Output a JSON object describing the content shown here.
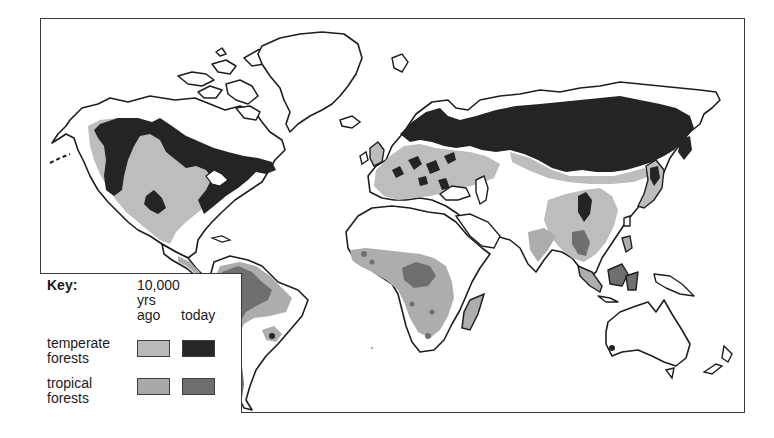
{
  "map": {
    "title": "World forest cover: 10,000 years ago vs today",
    "regions": [
      "North America",
      "Greenland",
      "South America",
      "Europe",
      "Africa",
      "Madagascar",
      "Asia",
      "Japan",
      "Southeast Asia",
      "Australia",
      "New Zealand"
    ]
  },
  "key": {
    "title": "Key:",
    "columns": {
      "ago_line1": "10,000",
      "ago_line2": "yrs",
      "ago_line3": "ago",
      "today": "today"
    },
    "rows": [
      {
        "label_line1": "temperate",
        "label_line2": "forests",
        "ago_color": "#b9b9b9",
        "today_color": "#262626"
      },
      {
        "label_line1": "tropical",
        "label_line2": "forests",
        "ago_color": "#a9a9a9",
        "today_color": "#6e6e6e"
      }
    ]
  },
  "colors": {
    "coastline": "#1e1e1e",
    "land": "#ffffff",
    "temperate_ago": "#bdbdbd",
    "temperate_today": "#242424",
    "tropical_ago": "#adadad",
    "tropical_today": "#6f6f6f"
  }
}
